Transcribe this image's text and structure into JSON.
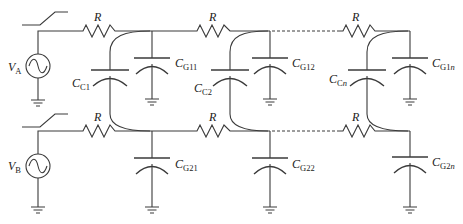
{
  "diagram": {
    "type": "circuit-schematic",
    "colors": {
      "line": "#3a3a3a",
      "background": "#ffffff",
      "text": "#222222"
    },
    "sources": [
      {
        "id": "VA",
        "label_main": "V",
        "label_sub": "A",
        "type": "ac-source-with-switch"
      },
      {
        "id": "VB",
        "label_main": "V",
        "label_sub": "B",
        "type": "ac-source-with-switch"
      }
    ],
    "resistors": [
      {
        "line": "A",
        "stage": 1,
        "label": "R"
      },
      {
        "line": "A",
        "stage": 2,
        "label": "R"
      },
      {
        "line": "A",
        "stage": "n",
        "label": "R"
      },
      {
        "line": "B",
        "stage": 1,
        "label": "R"
      },
      {
        "line": "B",
        "stage": 2,
        "label": "R"
      },
      {
        "line": "B",
        "stage": "n",
        "label": "R"
      }
    ],
    "coupling_capacitors": [
      {
        "label_main": "C",
        "label_sub": "C1",
        "sub_italic_part": ""
      },
      {
        "label_main": "C",
        "label_sub": "C2",
        "sub_italic_part": ""
      },
      {
        "label_main": "C",
        "label_sub": "C",
        "sub_italic_part": "n"
      }
    ],
    "ground_capacitors": [
      {
        "label_main": "C",
        "label_sub": "G11",
        "sub_italic_part": ""
      },
      {
        "label_main": "C",
        "label_sub": "G12",
        "sub_italic_part": ""
      },
      {
        "label_main": "C",
        "label_sub": "G1",
        "sub_italic_part": "n"
      },
      {
        "label_main": "C",
        "label_sub": "G21",
        "sub_italic_part": ""
      },
      {
        "label_main": "C",
        "label_sub": "G22",
        "sub_italic_part": ""
      },
      {
        "label_main": "C",
        "label_sub": "G2",
        "sub_italic_part": "n"
      }
    ],
    "continuation": "dashed lines between stage 2 and stage n"
  }
}
